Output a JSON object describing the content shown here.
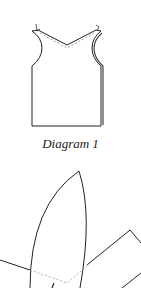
{
  "diagram1": {
    "caption": "Diagram 1",
    "description": "garment front panel with V-neck and curved armholes"
  },
  "diagram2": {
    "description": "pointed leaf-shaped piece with seam lines"
  },
  "colors": {
    "line": "#222222",
    "dashed": "#999999",
    "background": "#ffffff"
  }
}
